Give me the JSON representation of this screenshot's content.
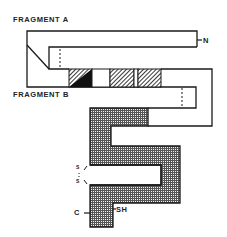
{
  "diagram": {
    "fragment_a_label": "FRAGMENT A",
    "fragment_b_label": "FRAGMENT B",
    "n_terminus_label": "N",
    "c_terminus_label": "C",
    "sh_label": "SH",
    "disulfide_label": "S·S",
    "disulfide_s1": "S",
    "disulfide_s2": "S",
    "colors": {
      "stroke": "#1a1a1a",
      "grid_fill": "#9a9a9a",
      "hatch": "#333333",
      "background": "#ffffff"
    }
  }
}
